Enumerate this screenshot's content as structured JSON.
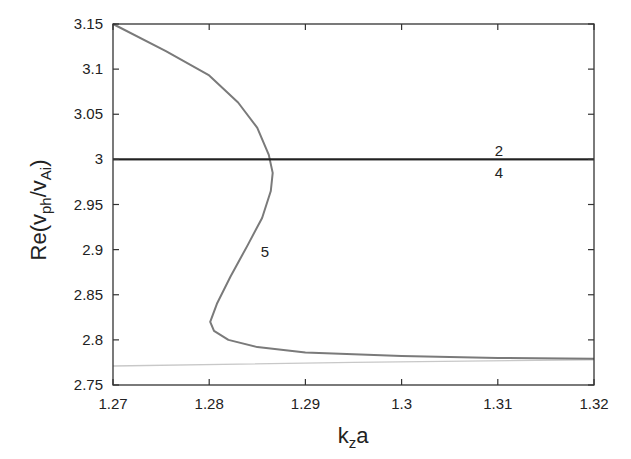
{
  "chart_data": {
    "type": "line",
    "title": "",
    "xlabel": "k_z a",
    "ylabel": "Re(v_ph/v_Ai)",
    "xlim": [
      1.27,
      1.32
    ],
    "ylim": [
      2.75,
      3.15
    ],
    "grid": false,
    "legend": "none (inline curve labels)",
    "x_ticks": [
      "1.27",
      "1.28",
      "1.29",
      "1.3",
      "1.31",
      "1.32"
    ],
    "y_ticks": [
      "2.75",
      "2.8",
      "2.85",
      "2.9",
      "2.95",
      "3",
      "3.05",
      "3.1",
      "3.15"
    ],
    "series": [
      {
        "name": "2",
        "color": "#222222",
        "points": [
          [
            1.27,
            3.0
          ],
          [
            1.32,
            3.0
          ]
        ]
      },
      {
        "name": "4",
        "color": "#222222",
        "points": [
          [
            1.27,
            3.0
          ],
          [
            1.32,
            3.0
          ]
        ]
      },
      {
        "name": "5",
        "color": "#7a7a7a",
        "points": [
          [
            1.27,
            3.15
          ],
          [
            1.2755,
            3.12
          ],
          [
            1.28,
            3.093
          ],
          [
            1.283,
            3.063
          ],
          [
            1.285,
            3.035
          ],
          [
            1.2862,
            3.005
          ],
          [
            1.2866,
            2.985
          ],
          [
            1.2864,
            2.965
          ],
          [
            1.2855,
            2.935
          ],
          [
            1.284,
            2.905
          ],
          [
            1.2822,
            2.87
          ],
          [
            1.2808,
            2.84
          ],
          [
            1.2801,
            2.82
          ],
          [
            1.2805,
            2.81
          ],
          [
            1.282,
            2.8
          ],
          [
            1.285,
            2.792
          ],
          [
            1.29,
            2.786
          ],
          [
            1.3,
            2.782
          ],
          [
            1.31,
            2.78
          ],
          [
            1.32,
            2.779
          ]
        ]
      },
      {
        "name": "unlabeled",
        "color": "#c8c8c8",
        "points": [
          [
            1.27,
            2.771
          ],
          [
            1.295,
            2.775
          ],
          [
            1.32,
            2.778
          ]
        ]
      }
    ],
    "annotations": [
      {
        "text": "2",
        "x": 1.31,
        "y": 3.008
      },
      {
        "text": "4",
        "x": 1.31,
        "y": 2.99
      },
      {
        "text": "5",
        "x": 1.2855,
        "y": 2.9
      }
    ]
  },
  "labels": {
    "xlabel_main": "k",
    "xlabel_sub": "z",
    "xlabel_tail": "a",
    "ylabel_prefix": "Re(v",
    "ylabel_sub1": "ph",
    "ylabel_mid": "/v",
    "ylabel_sub2": "Ai",
    "ylabel_suffix": ")",
    "curve_2": "2",
    "curve_4": "4",
    "curve_5": "5"
  }
}
